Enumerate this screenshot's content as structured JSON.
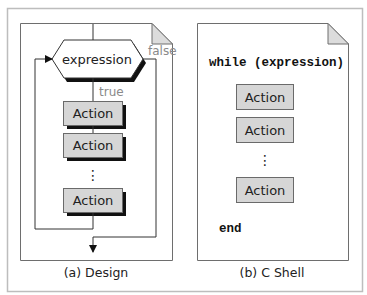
{
  "colors": {
    "outer_border": "#bdbdbd",
    "doc_border": "#6e6e6e",
    "line": "#333333",
    "action_fill": "#d6d6d6",
    "action_border": "#6a6a6a",
    "shadow": "#111111",
    "fold_fill": "#dcdcdc",
    "label_gray": "#8a8a8a",
    "text": "#222222"
  },
  "design": {
    "caption": "(a) Design",
    "condition": {
      "label": "expression",
      "true_label": "true",
      "false_label": "false"
    },
    "actions": [
      {
        "label": "Action"
      },
      {
        "label": "Action"
      },
      {
        "label": "Action"
      }
    ],
    "ellipsis": "⋮"
  },
  "cshell": {
    "caption": "(b) C Shell",
    "header_code": "while (expression)",
    "footer_code": "end",
    "actions": [
      {
        "label": "Action"
      },
      {
        "label": "Action"
      },
      {
        "label": "Action"
      }
    ],
    "ellipsis": "⋮"
  }
}
